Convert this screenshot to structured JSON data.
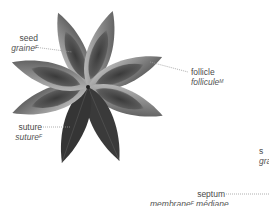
{
  "diagram": {
    "labels": [
      {
        "id": "seed",
        "en": "seed",
        "fr": "graine",
        "fr_gender": "F"
      },
      {
        "id": "follicle",
        "en": "follicle",
        "fr": "follicule",
        "fr_gender": "M"
      },
      {
        "id": "suture",
        "en": "suture",
        "fr": "suture",
        "fr_gender": "F"
      },
      {
        "id": "septum",
        "en": "septum",
        "fr": "membrane",
        "fr_gender": "F",
        "fr_suffix": "médiane"
      },
      {
        "id": "partial-right",
        "en": "s",
        "fr": "gra"
      }
    ],
    "colors": {
      "background": "#ffffff",
      "petal_dark": "#2e2e2e",
      "petal_mid": "#6a6a6a",
      "petal_light": "#b5b5b5",
      "label_text": "#4a4a4a",
      "leader_line": "#9a9a9a"
    }
  }
}
